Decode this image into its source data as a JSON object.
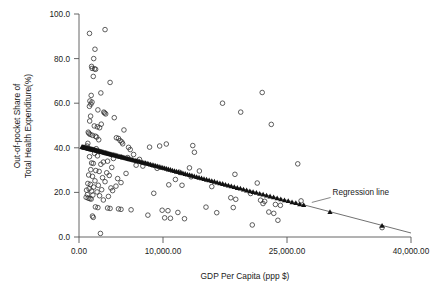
{
  "chart_data": {
    "type": "scatter",
    "title": "",
    "xlabel": "GDP Per Capita (ppp $)",
    "ylabel_line1": "Out-of-pocket Share of",
    "ylabel_line2": "Total Health Expenditure(%)",
    "xlim": [
      0,
      40000
    ],
    "ylim": [
      0,
      100
    ],
    "grid": false,
    "legend_position": "none",
    "xticks": [
      0,
      10000,
      25000,
      40000
    ],
    "xticklabels": [
      "0.00",
      "10,000.00",
      "25,000.00",
      "40,000.00"
    ],
    "xtick_pixel_positions": [
      79,
      163,
      287,
      411
    ],
    "yticks": [
      0,
      20,
      40,
      60,
      80,
      100
    ],
    "yticklabels": [
      "0.0",
      "20.0",
      "40.0",
      "60.0",
      "80.0",
      "100.0"
    ],
    "annotations": [
      {
        "text": "Regression line",
        "x": 31000,
        "y": 19.5,
        "leader_to_x": 28000,
        "leader_to_y": 15.5
      }
    ],
    "series": [
      {
        "name": "Observed (open circle)",
        "marker": "open-circle",
        "color": "#2b2b2b",
        "points": [
          [
            1250,
            91.3
          ],
          [
            3100,
            93.0
          ],
          [
            1900,
            84.2
          ],
          [
            1750,
            80.0
          ],
          [
            1500,
            76.5
          ],
          [
            1560,
            75.6
          ],
          [
            1850,
            75.4
          ],
          [
            1980,
            75.2
          ],
          [
            1700,
            72.0
          ],
          [
            3700,
            69.3
          ],
          [
            2600,
            64.6
          ],
          [
            1450,
            63.5
          ],
          [
            1300,
            61.0
          ],
          [
            1550,
            60.5
          ],
          [
            1420,
            59.6
          ],
          [
            1240,
            58.6
          ],
          [
            2250,
            57.0
          ],
          [
            2950,
            56.0
          ],
          [
            3050,
            55.6
          ],
          [
            3180,
            55.2
          ],
          [
            1380,
            54.2
          ],
          [
            4200,
            53.5
          ],
          [
            1270,
            52.0
          ],
          [
            2650,
            50.6
          ],
          [
            1820,
            49.8
          ],
          [
            2180,
            49.4
          ],
          [
            2450,
            49.0
          ],
          [
            5350,
            48.0
          ],
          [
            1100,
            47.0
          ],
          [
            1180,
            46.5
          ],
          [
            1320,
            46.0
          ],
          [
            1600,
            45.6
          ],
          [
            1950,
            45.2
          ],
          [
            2100,
            44.8
          ],
          [
            4450,
            44.5
          ],
          [
            4700,
            44.2
          ],
          [
            2350,
            43.6
          ],
          [
            4900,
            43.2
          ],
          [
            5100,
            42.6
          ],
          [
            1050,
            42.0
          ],
          [
            5200,
            41.8
          ],
          [
            10400,
            41.7
          ],
          [
            13600,
            41.0
          ],
          [
            960,
            40.8
          ],
          [
            5900,
            40.2
          ],
          [
            8400,
            40.3
          ],
          [
            2050,
            39.6
          ],
          [
            6100,
            39.2
          ],
          [
            13800,
            38.0
          ],
          [
            1850,
            37.5
          ],
          [
            6500,
            37.0
          ],
          [
            2200,
            36.4
          ],
          [
            1250,
            36.0
          ],
          [
            5800,
            35.6
          ],
          [
            4100,
            35.2
          ],
          [
            7200,
            34.8
          ],
          [
            26300,
            32.8
          ],
          [
            3400,
            34.0
          ],
          [
            2900,
            33.6
          ],
          [
            1500,
            33.2
          ],
          [
            1700,
            33.0
          ],
          [
            2600,
            32.6
          ],
          [
            6800,
            32.2
          ],
          [
            7600,
            31.8
          ],
          [
            3900,
            31.2
          ],
          [
            9300,
            30.8
          ],
          [
            13200,
            31.0
          ],
          [
            14400,
            29.6
          ],
          [
            12000,
            29.0
          ],
          [
            1400,
            30.2
          ],
          [
            2000,
            29.8
          ],
          [
            2400,
            29.4
          ],
          [
            3300,
            28.8
          ],
          [
            5600,
            28.5
          ],
          [
            18700,
            28.1
          ],
          [
            3600,
            27.6
          ],
          [
            13400,
            27.0
          ],
          [
            1150,
            27.8
          ],
          [
            1600,
            27.2
          ],
          [
            2800,
            26.6
          ],
          [
            4600,
            26.2
          ],
          [
            11500,
            25.8
          ],
          [
            1900,
            25.2
          ],
          [
            3100,
            24.8
          ],
          [
            5000,
            24.4
          ],
          [
            21400,
            24.2
          ],
          [
            1050,
            24.0
          ],
          [
            1350,
            23.6
          ],
          [
            2300,
            23.2
          ],
          [
            4400,
            22.8
          ],
          [
            10700,
            23.4
          ],
          [
            1750,
            22.4
          ],
          [
            3800,
            22.0
          ],
          [
            1200,
            21.6
          ],
          [
            2700,
            21.2
          ],
          [
            4000,
            20.8
          ],
          [
            15900,
            22.6
          ],
          [
            900,
            21.0
          ],
          [
            1500,
            20.6
          ],
          [
            2150,
            20.2
          ],
          [
            8900,
            19.6
          ],
          [
            20600,
            19.5
          ],
          [
            1000,
            19.0
          ],
          [
            1650,
            18.8
          ],
          [
            2450,
            18.5
          ],
          [
            3500,
            18.2
          ],
          [
            18200,
            17.6
          ],
          [
            18800,
            16.9
          ],
          [
            850,
            17.8
          ],
          [
            1100,
            17.4
          ],
          [
            1300,
            17.2
          ],
          [
            1450,
            17.0
          ],
          [
            2900,
            16.6
          ],
          [
            21800,
            16.5
          ],
          [
            22300,
            16.0
          ],
          [
            26700,
            16.2
          ],
          [
            22100,
            15.0
          ],
          [
            23600,
            14.6
          ],
          [
            24200,
            14.2
          ],
          [
            1950,
            13.5
          ],
          [
            2250,
            13.2
          ],
          [
            3400,
            13.0
          ],
          [
            3700,
            12.8
          ],
          [
            4700,
            12.6
          ],
          [
            5000,
            12.4
          ],
          [
            6200,
            12.2
          ],
          [
            9900,
            12.0
          ],
          [
            10600,
            11.8
          ],
          [
            11800,
            11.0
          ],
          [
            18500,
            13.2
          ],
          [
            22800,
            11.2
          ],
          [
            23400,
            10.6
          ],
          [
            8200,
            9.8
          ],
          [
            10200,
            8.6
          ],
          [
            10900,
            8.4
          ],
          [
            12600,
            8.2
          ],
          [
            1600,
            9.4
          ],
          [
            1700,
            8.8
          ],
          [
            23900,
            7.5
          ],
          [
            20800,
            5.4
          ],
          [
            2550,
            1.6
          ],
          [
            36500,
            4.2
          ],
          [
            17200,
            60.0
          ],
          [
            19400,
            56.0
          ],
          [
            22000,
            64.8
          ],
          [
            23100,
            50.5
          ],
          [
            9600,
            40.8
          ],
          [
            12300,
            23.2
          ],
          [
            16500,
            10.9
          ],
          [
            15200,
            13.4
          ]
        ]
      },
      {
        "name": "Fitted values (filled triangle)",
        "marker": "filled-triangle",
        "color": "#111111",
        "regression_line": {
          "x_start": 300,
          "y_start": 40.6,
          "x_end": 40000,
          "y_end": 1.8,
          "slope_per_1000usd": -0.977,
          "intercept": 40.9
        },
        "points": [
          [
            350,
            40.4
          ],
          [
            420,
            40.4
          ],
          [
            480,
            40.3
          ],
          [
            540,
            40.3
          ],
          [
            600,
            40.2
          ],
          [
            660,
            40.2
          ],
          [
            720,
            40.1
          ],
          [
            780,
            40.1
          ],
          [
            840,
            40.0
          ],
          [
            900,
            40.0
          ],
          [
            960,
            39.9
          ],
          [
            1020,
            39.9
          ],
          [
            1080,
            39.8
          ],
          [
            1140,
            39.8
          ],
          [
            1200,
            39.7
          ],
          [
            1260,
            39.6
          ],
          [
            1320,
            39.6
          ],
          [
            1380,
            39.5
          ],
          [
            1440,
            39.5
          ],
          [
            1500,
            39.4
          ],
          [
            1560,
            39.4
          ],
          [
            1620,
            39.3
          ],
          [
            1680,
            39.3
          ],
          [
            1740,
            39.2
          ],
          [
            1800,
            39.2
          ],
          [
            1870,
            39.1
          ],
          [
            1940,
            39.0
          ],
          [
            2010,
            39.0
          ],
          [
            2080,
            38.9
          ],
          [
            2150,
            38.8
          ],
          [
            2220,
            38.7
          ],
          [
            2300,
            38.7
          ],
          [
            2380,
            38.6
          ],
          [
            2460,
            38.5
          ],
          [
            2540,
            38.4
          ],
          [
            2620,
            38.3
          ],
          [
            2700,
            38.3
          ],
          [
            2790,
            38.2
          ],
          [
            2880,
            38.1
          ],
          [
            2970,
            38.0
          ],
          [
            3060,
            37.9
          ],
          [
            3150,
            37.8
          ],
          [
            3240,
            37.7
          ],
          [
            3340,
            37.6
          ],
          [
            3440,
            37.5
          ],
          [
            3540,
            37.4
          ],
          [
            3640,
            37.3
          ],
          [
            3740,
            37.2
          ],
          [
            3850,
            37.1
          ],
          [
            3960,
            37.0
          ],
          [
            4070,
            36.9
          ],
          [
            4180,
            36.8
          ],
          [
            4300,
            36.7
          ],
          [
            4420,
            36.6
          ],
          [
            4540,
            36.5
          ],
          [
            4660,
            36.3
          ],
          [
            4790,
            36.2
          ],
          [
            4920,
            36.1
          ],
          [
            5050,
            36.0
          ],
          [
            5180,
            35.8
          ],
          [
            5320,
            35.7
          ],
          [
            5460,
            35.6
          ],
          [
            5600,
            35.4
          ],
          [
            5750,
            35.3
          ],
          [
            5900,
            35.1
          ],
          [
            6050,
            35.0
          ],
          [
            6200,
            34.8
          ],
          [
            6360,
            34.7
          ],
          [
            6520,
            34.5
          ],
          [
            6680,
            34.4
          ],
          [
            6850,
            34.2
          ],
          [
            7020,
            34.1
          ],
          [
            7190,
            33.9
          ],
          [
            7370,
            33.7
          ],
          [
            7550,
            33.5
          ],
          [
            7730,
            33.4
          ],
          [
            7920,
            33.2
          ],
          [
            8110,
            33.0
          ],
          [
            8300,
            32.8
          ],
          [
            8500,
            32.6
          ],
          [
            8700,
            32.4
          ],
          [
            8900,
            32.2
          ],
          [
            9110,
            32.0
          ],
          [
            9320,
            31.8
          ],
          [
            9530,
            31.6
          ],
          [
            9750,
            31.3
          ],
          [
            9970,
            31.1
          ],
          [
            10200,
            30.9
          ],
          [
            10430,
            30.7
          ],
          [
            10660,
            30.4
          ],
          [
            10900,
            30.2
          ],
          [
            11140,
            29.9
          ],
          [
            11390,
            29.7
          ],
          [
            11640,
            29.4
          ],
          [
            11890,
            29.2
          ],
          [
            12150,
            28.9
          ],
          [
            12410,
            28.7
          ],
          [
            12680,
            28.4
          ],
          [
            12950,
            28.1
          ],
          [
            13220,
            27.9
          ],
          [
            13500,
            27.6
          ],
          [
            13780,
            27.3
          ],
          [
            14070,
            27.0
          ],
          [
            14360,
            26.7
          ],
          [
            14660,
            26.4
          ],
          [
            14960,
            26.1
          ],
          [
            15270,
            25.8
          ],
          [
            15580,
            25.5
          ],
          [
            15900,
            25.2
          ],
          [
            16220,
            24.9
          ],
          [
            16550,
            24.5
          ],
          [
            16880,
            24.2
          ],
          [
            17220,
            23.9
          ],
          [
            17560,
            23.5
          ],
          [
            17910,
            23.2
          ],
          [
            18260,
            22.8
          ],
          [
            18620,
            22.5
          ],
          [
            18990,
            22.1
          ],
          [
            19360,
            21.8
          ],
          [
            19740,
            21.4
          ],
          [
            20120,
            21.0
          ],
          [
            20510,
            20.6
          ],
          [
            20900,
            20.3
          ],
          [
            21300,
            19.9
          ],
          [
            21700,
            19.5
          ],
          [
            22110,
            19.1
          ],
          [
            22530,
            18.7
          ],
          [
            22950,
            18.3
          ],
          [
            23380,
            17.9
          ],
          [
            23810,
            17.5
          ],
          [
            24250,
            17.0
          ],
          [
            24700,
            16.6
          ],
          [
            25150,
            16.2
          ],
          [
            25610,
            15.7
          ],
          [
            26070,
            15.3
          ],
          [
            26540,
            14.8
          ],
          [
            27020,
            14.4
          ],
          [
            30200,
            11.3
          ],
          [
            36500,
            5.1
          ]
        ]
      }
    ]
  },
  "axes": {
    "xtitle": "GDP Per Capita (ppp $)",
    "ytitle_line1": "Out-of-pocket Share of",
    "ytitle_line2": "Total Health Expenditure(%)"
  },
  "annotation": {
    "regression_label": "Regression line"
  },
  "colors": {
    "background": "#ffffff",
    "axis": "#555555",
    "marker_open": "#2b2b2b",
    "marker_fill": "#111111",
    "line": "#333333",
    "text": "#1a1a1a"
  }
}
